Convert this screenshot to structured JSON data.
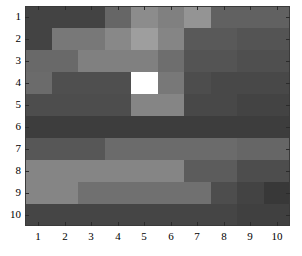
{
  "figure": {
    "kind": "grayscale-heatmap",
    "background_color": "#ffffff",
    "axis_line_color": "#3a3a3a",
    "tick_color": "#2b2b2b",
    "label_color": "#000000"
  },
  "axes": {
    "x_tick_labels": [
      "1",
      "2",
      "3",
      "4",
      "5",
      "6",
      "7",
      "8",
      "9",
      "10"
    ],
    "y_tick_labels": [
      "1",
      "2",
      "3",
      "4",
      "5",
      "6",
      "7",
      "8",
      "9",
      "10"
    ],
    "xlabel": "",
    "ylabel": "",
    "title": ""
  },
  "chart_data": {
    "type": "heatmap",
    "title": "",
    "xlabel": "",
    "ylabel": "",
    "grid": false,
    "legend": "none",
    "colormap": "gray",
    "x": [
      1,
      2,
      3,
      4,
      5,
      6,
      7,
      8,
      9,
      10
    ],
    "y": [
      1,
      2,
      3,
      4,
      5,
      6,
      7,
      8,
      9,
      10
    ],
    "xlim": [
      0.5,
      10.5
    ],
    "ylim": [
      0.5,
      10.5
    ],
    "y_axis_direction": "reversed",
    "value_range": [
      0.0,
      1.0
    ],
    "max_cell": {
      "row": 4,
      "column": 5,
      "value": 1.0
    },
    "row_labels": [
      "1",
      "2",
      "3",
      "4",
      "5",
      "6",
      "7",
      "8",
      "9",
      "10"
    ],
    "column_labels": [
      "1",
      "2",
      "3",
      "4",
      "5",
      "6",
      "7",
      "8",
      "9",
      "10"
    ],
    "values": [
      [
        0.26,
        0.26,
        0.26,
        0.4,
        0.55,
        0.5,
        0.58,
        0.38,
        0.38,
        0.38
      ],
      [
        0.26,
        0.47,
        0.47,
        0.53,
        0.62,
        0.52,
        0.35,
        0.35,
        0.33,
        0.33
      ],
      [
        0.41,
        0.41,
        0.5,
        0.5,
        0.5,
        0.43,
        0.33,
        0.33,
        0.31,
        0.31
      ],
      [
        0.42,
        0.31,
        0.31,
        0.31,
        1.0,
        0.47,
        0.3,
        0.28,
        0.28,
        0.28
      ],
      [
        0.3,
        0.3,
        0.3,
        0.3,
        0.52,
        0.52,
        0.28,
        0.28,
        0.26,
        0.26
      ],
      [
        0.24,
        0.24,
        0.24,
        0.24,
        0.24,
        0.24,
        0.24,
        0.24,
        0.24,
        0.24
      ],
      [
        0.34,
        0.34,
        0.34,
        0.42,
        0.42,
        0.42,
        0.42,
        0.42,
        0.4,
        0.4
      ],
      [
        0.52,
        0.52,
        0.52,
        0.52,
        0.52,
        0.52,
        0.36,
        0.36,
        0.3,
        0.3
      ],
      [
        0.52,
        0.52,
        0.44,
        0.44,
        0.44,
        0.44,
        0.44,
        0.3,
        0.26,
        0.22
      ],
      [
        0.27,
        0.27,
        0.27,
        0.27,
        0.27,
        0.27,
        0.27,
        0.27,
        0.25,
        0.25
      ]
    ],
    "cell_colors": [
      [
        "#434343",
        "#434343",
        "#434343",
        "#666666",
        "#8c8c8c",
        "#808080",
        "#949494",
        "#616161",
        "#616161",
        "#616161"
      ],
      [
        "#434343",
        "#787878",
        "#787878",
        "#888888",
        "#9e9e9e",
        "#858585",
        "#595959",
        "#595959",
        "#545454",
        "#545454"
      ],
      [
        "#696969",
        "#696969",
        "#808080",
        "#808080",
        "#808080",
        "#6e6e6e",
        "#545454",
        "#545454",
        "#4f4f4f",
        "#4f4f4f"
      ],
      [
        "#6b6b6b",
        "#4f4f4f",
        "#4f4f4f",
        "#4f4f4f",
        "#ffffff",
        "#787878",
        "#4d4d4d",
        "#484848",
        "#484848",
        "#484848"
      ],
      [
        "#4d4d4d",
        "#4d4d4d",
        "#4d4d4d",
        "#4d4d4d",
        "#858585",
        "#858585",
        "#484848",
        "#484848",
        "#434343",
        "#434343"
      ],
      [
        "#3d3d3d",
        "#3d3d3d",
        "#3d3d3d",
        "#3d3d3d",
        "#3d3d3d",
        "#3d3d3d",
        "#3d3d3d",
        "#3d3d3d",
        "#3d3d3d",
        "#3d3d3d"
      ],
      [
        "#575757",
        "#575757",
        "#575757",
        "#6b6b6b",
        "#6b6b6b",
        "#6b6b6b",
        "#6b6b6b",
        "#6b6b6b",
        "#666666",
        "#666666"
      ],
      [
        "#858585",
        "#858585",
        "#858585",
        "#858585",
        "#858585",
        "#858585",
        "#5c5c5c",
        "#5c5c5c",
        "#4d4d4d",
        "#4d4d4d"
      ],
      [
        "#858585",
        "#858585",
        "#707070",
        "#707070",
        "#707070",
        "#707070",
        "#707070",
        "#4d4d4d",
        "#434343",
        "#383838"
      ],
      [
        "#454545",
        "#454545",
        "#454545",
        "#454545",
        "#454545",
        "#454545",
        "#454545",
        "#454545",
        "#404040",
        "#404040"
      ]
    ]
  }
}
